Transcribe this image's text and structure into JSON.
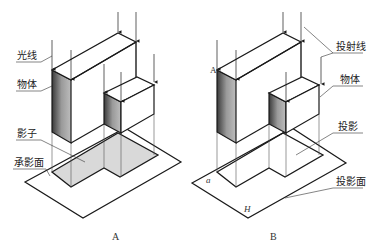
{
  "figure": {
    "panels": [
      {
        "id": "A",
        "caption": "A",
        "labels": {
          "light_rays": "光线",
          "object": "物体",
          "shadow": "影子",
          "shadow_plane": "承影面"
        }
      },
      {
        "id": "B",
        "caption": "B",
        "labels": {
          "projection_lines": "投射线",
          "object": "物体",
          "projection": "投影",
          "projection_plane": "投影面"
        },
        "points": {
          "vertex_upper": "A",
          "vertex_lower": "a",
          "plane": "H"
        }
      }
    ],
    "colors": {
      "line": "#1a1a1a",
      "thin_line": "#555555",
      "shadow_fill": "#d9d9d9",
      "face_dark": "#6a6a6a"
    }
  }
}
